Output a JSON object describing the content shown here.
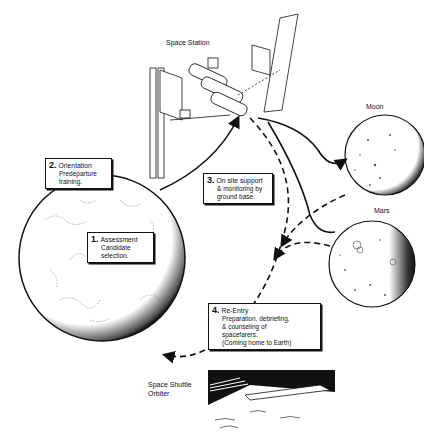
{
  "labels": {
    "space_station": "Space Station",
    "moon": "Moon",
    "mars": "Mars",
    "shuttle_line1": "Space Shuttle",
    "shuttle_line2": "Orbiter"
  },
  "steps": [
    {
      "num": "1.",
      "title": "Assessment",
      "lines": [
        "Candidate",
        "selection."
      ]
    },
    {
      "num": "2.",
      "title": "Orientation",
      "lines": [
        "Predeparture",
        "training."
      ]
    },
    {
      "num": "3.",
      "title": "On site support",
      "lines": [
        "& monitoring by",
        "ground base."
      ]
    },
    {
      "num": "4.",
      "title": "Re-Entry",
      "lines": [
        "Preparation, debriefing,",
        "& counseling of",
        "spacefarers.",
        "(Coming home to Earth)"
      ]
    }
  ],
  "colors": {
    "ink": "#111111",
    "paper": "#ffffff"
  }
}
